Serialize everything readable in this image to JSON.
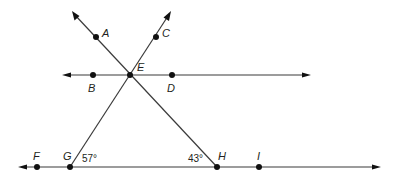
{
  "diagram": {
    "type": "geometry-lines",
    "colors": {
      "line": "#3a3a3a",
      "point": "#111111",
      "text": "#231f20",
      "background": "#ffffff"
    },
    "points": {
      "A": {
        "label": "A",
        "x": 96,
        "y": 37
      },
      "C": {
        "label": "C",
        "x": 156,
        "y": 37
      },
      "B": {
        "label": "B",
        "x": 93,
        "y": 75
      },
      "E": {
        "label": "E",
        "x": 130,
        "y": 75
      },
      "D": {
        "label": "D",
        "x": 172,
        "y": 75
      },
      "F": {
        "label": "F",
        "x": 37,
        "y": 167
      },
      "G": {
        "label": "G",
        "x": 70,
        "y": 167
      },
      "H": {
        "label": "H",
        "x": 217,
        "y": 167
      },
      "I": {
        "label": "I",
        "x": 259,
        "y": 167
      }
    },
    "lines": [
      {
        "name": "line-BD",
        "through": [
          "B",
          "E",
          "D"
        ],
        "arrows": "both"
      },
      {
        "name": "line-FI",
        "through": [
          "F",
          "G",
          "H",
          "I"
        ],
        "arrows": "both"
      },
      {
        "name": "ray-EA-H",
        "through": [
          "A",
          "E",
          "H"
        ],
        "arrows": "start"
      },
      {
        "name": "ray-EC-G",
        "through": [
          "C",
          "E",
          "G"
        ],
        "arrows": "start"
      }
    ],
    "angles": [
      {
        "vertex": "G",
        "label": "57°"
      },
      {
        "vertex": "H",
        "label": "43°"
      }
    ]
  }
}
